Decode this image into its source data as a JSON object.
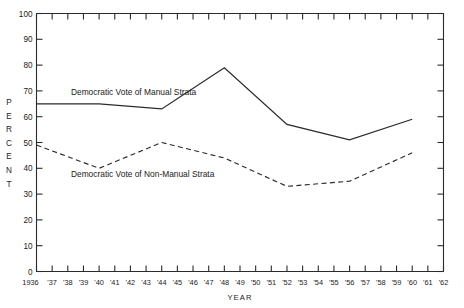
{
  "chart_data": {
    "type": "line",
    "title": "",
    "xlabel": "YEAR",
    "ylabel": "PERCENT",
    "ylim": [
      0,
      100
    ],
    "xlim": [
      1936,
      1962
    ],
    "grid": false,
    "legend_position": "inline-annotations",
    "y_ticks": [
      0,
      10,
      20,
      30,
      40,
      50,
      60,
      70,
      80,
      90,
      100
    ],
    "x_ticks": [
      "1936",
      "'37",
      "'38",
      "'39",
      "'40",
      "'41",
      "'42",
      "'43",
      "'44",
      "'45",
      "'46",
      "'47",
      "'48",
      "'49",
      "'50",
      "'51",
      "'52",
      "'53",
      "'54",
      "'55",
      "'56",
      "'57",
      "'58",
      "'59",
      "'60",
      "'61",
      "'62"
    ],
    "x_tick_years": [
      1936,
      1937,
      1938,
      1939,
      1940,
      1941,
      1942,
      1943,
      1944,
      1945,
      1946,
      1947,
      1948,
      1949,
      1950,
      1951,
      1952,
      1953,
      1954,
      1955,
      1956,
      1957,
      1958,
      1959,
      1960,
      1961,
      1962
    ],
    "series": [
      {
        "name": "Democratic Vote of Manual Strata",
        "style": "solid",
        "color": "#2b2b2b",
        "x": [
          1936,
          1940,
          1944,
          1948,
          1952,
          1956,
          1960
        ],
        "values": [
          65,
          65,
          63,
          79,
          57,
          51,
          59
        ]
      },
      {
        "name": "Democratic Vote of Non-Manual Strata",
        "style": "dashed",
        "color": "#2b2b2b",
        "x": [
          1936,
          1940,
          1944,
          1948,
          1952,
          1956,
          1960
        ],
        "values": [
          49,
          40,
          50,
          44,
          33,
          35,
          46
        ]
      }
    ],
    "annotations": [
      {
        "text": "Democratic Vote of Manual Strata",
        "year": 1938.2,
        "value": 68.5
      },
      {
        "text": "Democratic Vote of Non-Manual Strata",
        "year": 1938.2,
        "value": 36.5
      }
    ]
  },
  "axis_y_letters": [
    "P",
    "E",
    "R",
    "C",
    "E",
    "N",
    "T"
  ]
}
